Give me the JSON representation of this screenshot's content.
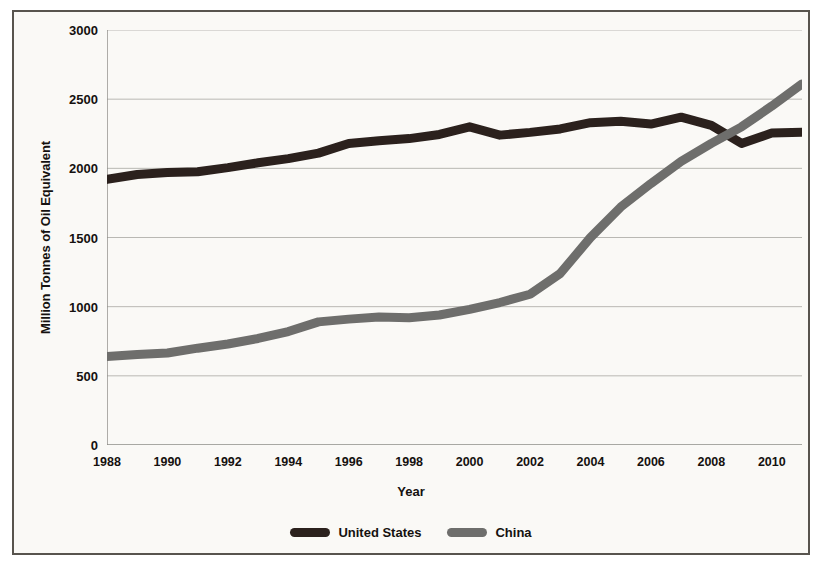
{
  "chart_data": {
    "type": "line",
    "title": "",
    "xlabel": "Year",
    "ylabel": "Million Tonnes of Oil Equivalent",
    "xlim": [
      1988,
      2011
    ],
    "ylim": [
      0,
      3000
    ],
    "ytick_values": [
      0,
      500,
      1000,
      1500,
      2000,
      2500,
      3000
    ],
    "ytick_labels": [
      "0",
      "500",
      "1000",
      "1500",
      "2000",
      "2500",
      "3000"
    ],
    "xtick_values": [
      1988,
      1990,
      1992,
      1994,
      1996,
      1998,
      2000,
      2002,
      2004,
      2006,
      2008,
      2010
    ],
    "xtick_labels": [
      "1988",
      "1990",
      "1992",
      "1994",
      "1996",
      "1998",
      "2000",
      "2002",
      "2004",
      "2006",
      "2008",
      "2010"
    ],
    "grid": true,
    "legend_position": "bottom",
    "x": [
      1988,
      1989,
      1990,
      1991,
      1992,
      1993,
      1994,
      1995,
      1996,
      1997,
      1998,
      1999,
      2000,
      2001,
      2002,
      2003,
      2004,
      2005,
      2006,
      2007,
      2008,
      2009,
      2010,
      2011
    ],
    "series": [
      {
        "name": "United States",
        "color": "#2b211d",
        "values": [
          1920,
          1955,
          1970,
          1975,
          2005,
          2040,
          2070,
          2110,
          2180,
          2200,
          2215,
          2245,
          2300,
          2240,
          2260,
          2285,
          2330,
          2340,
          2320,
          2370,
          2310,
          2180,
          2255,
          2260
        ]
      },
      {
        "name": "China",
        "color": "#6e6e6c",
        "values": [
          640,
          655,
          665,
          700,
          730,
          770,
          820,
          890,
          910,
          925,
          920,
          940,
          980,
          1030,
          1090,
          1240,
          1500,
          1720,
          1890,
          2050,
          2180,
          2300,
          2450,
          2610
        ]
      }
    ]
  },
  "legend": {
    "items": [
      {
        "label": "United States",
        "color": "#2b211d"
      },
      {
        "label": "China",
        "color": "#6e6e6c"
      }
    ]
  }
}
